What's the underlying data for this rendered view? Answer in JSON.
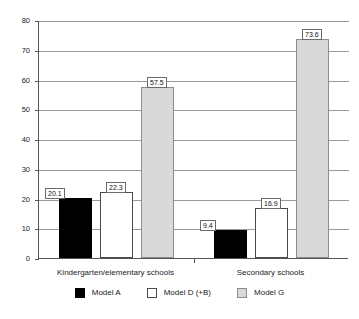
{
  "chart_data": {
    "type": "bar",
    "title": "",
    "subtitle": "",
    "xlabel": "",
    "ylabel": "",
    "categories": [
      "Kindergarten/elementary schools",
      "Secondary schools"
    ],
    "series": [
      {
        "name": "Model A",
        "color": "#000000",
        "values": [
          20.1,
          9.4
        ]
      },
      {
        "name": "Model D (+B)",
        "color": "#ffffff",
        "values": [
          22.3,
          16.9
        ]
      },
      {
        "name": "Model G",
        "color": "#d9d9d9",
        "values": [
          57.5,
          73.6
        ]
      }
    ],
    "ylim": [
      0,
      80
    ],
    "ytick_labels": [
      "0",
      "10",
      "20",
      "30",
      "40",
      "50",
      "60",
      "70",
      "80"
    ],
    "ytick_values": [
      0,
      10,
      20,
      30,
      40,
      50,
      60,
      70,
      80
    ],
    "grid": true,
    "legend_position": "bottom",
    "data_labels": [
      "20.1",
      "22.3",
      "57.5",
      "9.4",
      "16.9",
      "73.6"
    ]
  },
  "legend": {
    "items": [
      {
        "label": "Model A",
        "swatch": "black"
      },
      {
        "label": "Model D (+B)",
        "swatch": "white"
      },
      {
        "label": "Model G",
        "swatch": "gray"
      }
    ]
  },
  "colors": {
    "series_a": "#000000",
    "series_d": "#ffffff",
    "series_g": "#d9d9d9",
    "axis": "#555555",
    "grid": "#9a9a9a",
    "background": "#ffffff"
  }
}
